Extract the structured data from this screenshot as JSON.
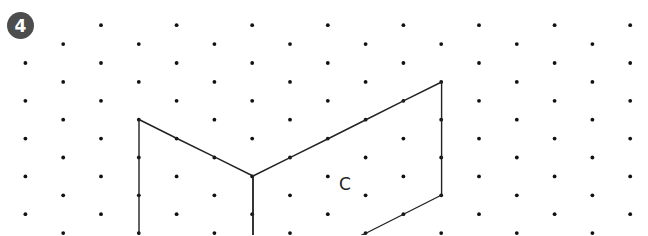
{
  "exercise": {
    "number": "4",
    "badge_color": "#4d4d4d"
  },
  "grid": {
    "type": "isometric-dot-grid",
    "columns": 17,
    "x0": 25.4,
    "dx": 37.8,
    "even_y0": 25.2,
    "odd_y0": 44.1,
    "dy": 37.8,
    "rows": 6,
    "dot_radius": 1.9,
    "dot_color": "#111111"
  },
  "shapes": [
    {
      "id": "left-shape",
      "label": "",
      "stroke": "#222222",
      "polyline": [
        [
          139,
          236
        ],
        [
          139,
          119.5
        ],
        [
          177,
          138.5
        ],
        [
          215,
          157.2
        ],
        [
          253,
          176
        ],
        [
          253,
          236
        ]
      ]
    },
    {
      "id": "shape-c",
      "label": "C",
      "stroke": "#222222",
      "polyline": [
        [
          253,
          236
        ],
        [
          253,
          176
        ],
        [
          291,
          157.2
        ],
        [
          328.6,
          138.5
        ],
        [
          366.4,
          119.5
        ],
        [
          404,
          100.7
        ],
        [
          441.6,
          82
        ],
        [
          441.6,
          195
        ],
        [
          404,
          214
        ],
        [
          366.4,
          233
        ],
        [
          360,
          236
        ]
      ]
    }
  ],
  "labels": {
    "shape_c": "C"
  }
}
